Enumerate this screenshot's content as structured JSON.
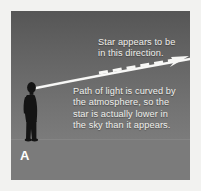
{
  "figure": {
    "panel_label": "A",
    "background_color": "#f2f2f0",
    "sky_color_top": "#565656",
    "sky_color_horizon": "#7b7b7b",
    "ground_color": "#7b7b7b",
    "beam_color": "#ffffff",
    "text_color": "#f0f0ec",
    "silhouette_color": "#141414"
  },
  "callouts": {
    "apparent_direction": "Star appears to be\nin this direction.",
    "refraction_explanation": "Path of light is curved by\nthe atmosphere, so the\nstar is actually lower in\nthe sky than it appears."
  },
  "diagram_elements": {
    "observer": "person-silhouette",
    "actual_light_path": "curved-solid-beam",
    "apparent_light_path": "dashed-line-with-arrowhead",
    "horizon": "ground-horizon-line"
  }
}
